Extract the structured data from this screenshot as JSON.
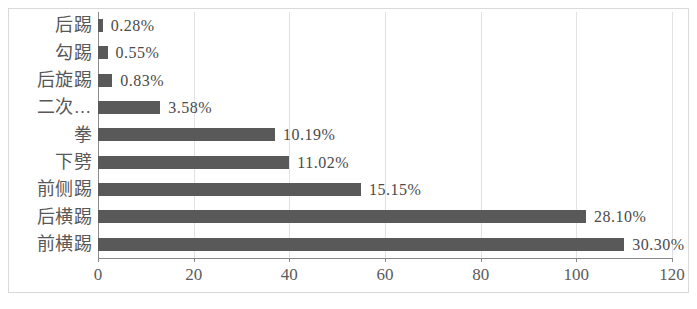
{
  "chart_data": {
    "type": "bar",
    "orientation": "horizontal",
    "title": "",
    "subtitle": "",
    "xlabel": "",
    "ylabel": "",
    "xlim": [
      0,
      120
    ],
    "xticks": [
      "0",
      "20",
      "40",
      "60",
      "80",
      "100",
      "120"
    ],
    "xtick_values": [
      0,
      20,
      40,
      60,
      80,
      100,
      120
    ],
    "grid": true,
    "legend": false,
    "categories": [
      "后踢",
      "勾踢",
      "后旋踢",
      "二次…",
      "拳",
      "下劈",
      "前侧踢",
      "后横踢",
      "前横踢"
    ],
    "values": [
      1,
      2,
      3,
      13,
      37,
      40,
      55,
      102,
      110
    ],
    "data_labels": [
      "0.28%",
      "0.55%",
      "0.83%",
      "3.58%",
      "10.19%",
      "11.02%",
      "15.15%",
      "28.10%",
      "30.30%"
    ],
    "percent_values": [
      0.28,
      0.55,
      0.83,
      3.58,
      10.19,
      11.02,
      15.15,
      28.1,
      30.3
    ],
    "series": [
      {
        "name": "",
        "values": [
          1,
          2,
          3,
          13,
          37,
          40,
          55,
          102,
          110
        ]
      }
    ],
    "colors": {
      "bar": "#595959",
      "grid": "#e2e2e2",
      "axis": "#8a8a8a",
      "label_text": "#4a4a4a",
      "category_text": "#585858",
      "background": "#ffffff",
      "frame": "#d9d9d9"
    }
  }
}
